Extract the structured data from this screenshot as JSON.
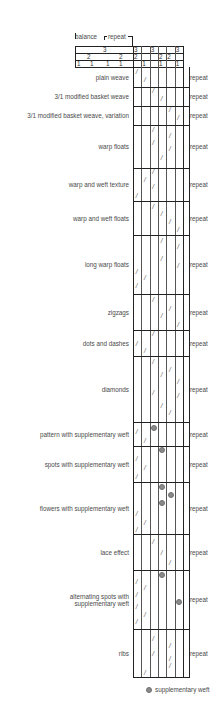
{
  "header": {
    "balance_label": "balance",
    "repeat_label": "repeat",
    "rows": [
      {
        "left": [
          {
            "x": 103,
            "v": "3"
          }
        ],
        "cells": [
          "3",
          "",
          "3",
          "",
          "",
          "3"
        ]
      },
      {
        "left": [
          {
            "x": 87,
            "v": "2"
          },
          {
            "x": 119,
            "v": "2"
          }
        ],
        "cells": [
          "2",
          "",
          "",
          "2",
          "2",
          ""
        ]
      },
      {
        "left": [
          {
            "x": 77,
            "v": "1"
          },
          {
            "x": 90,
            "v": "1"
          },
          {
            "x": 106,
            "v": "1"
          },
          {
            "x": 119,
            "v": "1"
          }
        ],
        "cells": [
          "",
          "1",
          "",
          "1",
          "",
          "1"
        ]
      }
    ]
  },
  "grid": {
    "left": 133,
    "right": 183,
    "cols": 6,
    "header_top": 46,
    "header_left": 75,
    "header_row_h": 7,
    "rep_right": 189
  },
  "weaves": [
    {
      "label": "plain weave",
      "top": 67,
      "bottom": 87,
      "marks": [
        [
          0,
          0.2
        ],
        [
          1,
          0.6
        ]
      ]
    },
    {
      "label": "3/1 modified basket weave",
      "top": 87,
      "bottom": 106,
      "marks": [
        [
          2,
          0.2
        ],
        [
          3,
          0.6
        ]
      ]
    },
    {
      "label": "3/1 modified basket weave, variation",
      "top": 106,
      "bottom": 125,
      "marks": [
        [
          4,
          0.2
        ],
        [
          5,
          0.6
        ]
      ]
    },
    {
      "label": "warp floats",
      "top": 125,
      "bottom": 168,
      "marks": [
        [
          2,
          0.1
        ],
        [
          4,
          0.25
        ],
        [
          2,
          0.4
        ],
        [
          4,
          0.55
        ],
        [
          3,
          0.75
        ]
      ]
    },
    {
      "label": "warp and weft texture",
      "top": 168,
      "bottom": 201,
      "marks": [
        [
          2,
          0.1
        ],
        [
          1,
          0.35
        ],
        [
          2,
          0.55
        ],
        [
          0,
          0.82
        ]
      ]
    },
    {
      "label": "warp and weft floats",
      "top": 201,
      "bottom": 235,
      "marks": [
        [
          2,
          0.15
        ],
        [
          3,
          0.38
        ],
        [
          4,
          0.6
        ],
        [
          5,
          0.83
        ]
      ]
    },
    {
      "label": "long warp floats",
      "top": 235,
      "bottom": 294,
      "marks": [
        [
          3,
          0.1
        ],
        [
          5,
          0.2
        ],
        [
          3,
          0.4
        ],
        [
          5,
          0.52
        ],
        [
          0,
          0.62
        ],
        [
          1,
          0.72
        ],
        [
          0,
          0.85
        ]
      ]
    },
    {
      "label": "zigzags",
      "top": 294,
      "bottom": 330,
      "marks": [
        [
          2,
          0.15
        ],
        [
          4,
          0.4
        ],
        [
          3,
          0.6
        ],
        [
          5,
          0.85
        ]
      ]
    },
    {
      "label": "dots and dashes",
      "top": 330,
      "bottom": 356,
      "marks": [
        [
          2,
          0.15
        ],
        [
          0,
          0.5
        ],
        [
          1,
          0.8
        ]
      ]
    },
    {
      "label": "diamonds",
      "top": 356,
      "bottom": 422,
      "marks": [
        [
          2,
          0.08
        ],
        [
          4,
          0.2
        ],
        [
          3,
          0.28
        ],
        [
          5,
          0.38
        ],
        [
          2,
          0.55
        ],
        [
          5,
          0.6
        ],
        [
          3,
          0.75
        ],
        [
          4,
          0.85
        ]
      ]
    },
    {
      "label": "pattern with supplementary weft",
      "top": 422,
      "bottom": 446,
      "marks": [
        [
          0,
          0.4
        ],
        [
          1,
          0.75
        ]
      ],
      "dots": [
        [
          2,
          0.25
        ]
      ]
    },
    {
      "label": "spots with supplementary weft",
      "top": 446,
      "bottom": 482,
      "marks": [
        [
          0,
          0.35
        ],
        [
          1,
          0.6
        ],
        [
          0,
          0.85
        ]
      ],
      "dots": [
        [
          3,
          0.12
        ]
      ]
    },
    {
      "label": "flowers with supplementary weft",
      "top": 482,
      "bottom": 534,
      "marks": [
        [
          0,
          0.6
        ],
        [
          1,
          0.78
        ],
        [
          0,
          0.92
        ]
      ],
      "dots": [
        [
          3,
          0.1
        ],
        [
          4,
          0.25
        ],
        [
          3,
          0.4
        ]
      ]
    },
    {
      "label": "lace effect",
      "top": 534,
      "bottom": 570,
      "marks": [
        [
          2,
          0.2
        ],
        [
          3,
          0.5
        ],
        [
          4,
          0.78
        ]
      ]
    },
    {
      "label": "alternating spots with supplementary weft",
      "label_lines": [
        "alternating spots with",
        "supplementary weft"
      ],
      "top": 570,
      "bottom": 629,
      "marks": [
        [
          0,
          0.2
        ],
        [
          1,
          0.3
        ],
        [
          0,
          0.42
        ],
        [
          0,
          0.62
        ],
        [
          1,
          0.76
        ],
        [
          0,
          0.88
        ]
      ],
      "dots": [
        [
          3,
          0.08
        ],
        [
          5,
          0.55
        ]
      ]
    },
    {
      "label": "ribs",
      "top": 629,
      "bottom": 677,
      "marks": [
        [
          2,
          0.2
        ],
        [
          4,
          0.35
        ],
        [
          2,
          0.5
        ],
        [
          4,
          0.62
        ],
        [
          4,
          0.75
        ],
        [
          1,
          0.9
        ]
      ]
    }
  ],
  "repeat_label": "repeat",
  "legend": {
    "label": "supplementary weft",
    "dot_color": "#8a8a8a"
  }
}
